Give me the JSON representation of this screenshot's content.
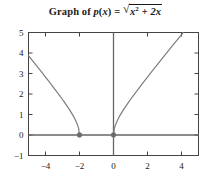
{
  "chart_data": {
    "type": "line",
    "title_parts": {
      "prefix": "Graph of ",
      "function_name": "p",
      "arg_open": "(",
      "arg_var": "x",
      "arg_close": ")",
      "equals": " = ",
      "radical_sign": "√",
      "radicand_term1_base": "x",
      "radicand_term1_exp": "2",
      "radicand_plus": " + ",
      "radicand_term2": "2x"
    },
    "xlabel": "",
    "ylabel": "",
    "xlim": [
      -5,
      5
    ],
    "ylim": [
      -1,
      5
    ],
    "xticks": [
      -4,
      -2,
      0,
      2,
      4
    ],
    "xtick_labels": [
      "−4",
      "−2",
      "0",
      "2",
      "4"
    ],
    "yticks": [
      -1,
      0,
      1,
      2,
      3,
      4,
      5
    ],
    "ytick_labels": [
      "−1",
      "0",
      "1",
      "2",
      "3",
      "4",
      "5"
    ],
    "grid": false,
    "legend": null,
    "axis_lines": {
      "x_axis_at_y": 0,
      "y_axis_at_x": 0,
      "color": "#666666"
    },
    "frame": {
      "visible": true,
      "color": "#444444"
    },
    "curve_color": "#7d7d7d",
    "marker_color": "#6b6b6b",
    "endpoint_markers": [
      {
        "x": -2,
        "y": 0,
        "style": "filled-circle"
      },
      {
        "x": 0,
        "y": 0,
        "style": "filled-circle"
      }
    ],
    "series": [
      {
        "name": "left-branch",
        "note": "x ≤ −2",
        "points": [
          {
            "x": -5.0,
            "y": 3.873
          },
          {
            "x": -4.8,
            "y": 3.666
          },
          {
            "x": -4.6,
            "y": 3.458
          },
          {
            "x": -4.4,
            "y": 3.25
          },
          {
            "x": -4.2,
            "y": 3.041
          },
          {
            "x": -4.0,
            "y": 2.828
          },
          {
            "x": -3.8,
            "y": 2.615
          },
          {
            "x": -3.6,
            "y": 2.4
          },
          {
            "x": -3.4,
            "y": 2.182
          },
          {
            "x": -3.2,
            "y": 1.96
          },
          {
            "x": -3.0,
            "y": 1.732
          },
          {
            "x": -2.9,
            "y": 1.616
          },
          {
            "x": -2.8,
            "y": 1.497
          },
          {
            "x": -2.7,
            "y": 1.375
          },
          {
            "x": -2.6,
            "y": 1.249
          },
          {
            "x": -2.5,
            "y": 1.118
          },
          {
            "x": -2.4,
            "y": 0.98
          },
          {
            "x": -2.3,
            "y": 0.831
          },
          {
            "x": -2.2,
            "y": 0.663
          },
          {
            "x": -2.1,
            "y": 0.458
          },
          {
            "x": -2.05,
            "y": 0.32
          },
          {
            "x": -2.0,
            "y": 0.0
          }
        ]
      },
      {
        "name": "right-branch",
        "note": "x ≥ 0",
        "points": [
          {
            "x": 0.0,
            "y": 0.0
          },
          {
            "x": 0.05,
            "y": 0.32
          },
          {
            "x": 0.1,
            "y": 0.458
          },
          {
            "x": 0.2,
            "y": 0.663
          },
          {
            "x": 0.3,
            "y": 0.831
          },
          {
            "x": 0.4,
            "y": 0.98
          },
          {
            "x": 0.5,
            "y": 1.118
          },
          {
            "x": 0.6,
            "y": 1.249
          },
          {
            "x": 0.7,
            "y": 1.375
          },
          {
            "x": 0.8,
            "y": 1.497
          },
          {
            "x": 0.9,
            "y": 1.616
          },
          {
            "x": 1.0,
            "y": 1.732
          },
          {
            "x": 1.2,
            "y": 1.96
          },
          {
            "x": 1.4,
            "y": 2.182
          },
          {
            "x": 1.6,
            "y": 2.4
          },
          {
            "x": 1.8,
            "y": 2.615
          },
          {
            "x": 2.0,
            "y": 2.828
          },
          {
            "x": 2.2,
            "y": 3.041
          },
          {
            "x": 2.4,
            "y": 3.25
          },
          {
            "x": 2.6,
            "y": 3.458
          },
          {
            "x": 2.8,
            "y": 3.666
          },
          {
            "x": 3.0,
            "y": 3.873
          },
          {
            "x": 3.2,
            "y": 4.079
          },
          {
            "x": 3.4,
            "y": 4.284
          },
          {
            "x": 3.6,
            "y": 4.49
          },
          {
            "x": 3.8,
            "y": 4.694
          },
          {
            "x": 4.0,
            "y": 4.899
          },
          {
            "x": 4.1,
            "y": 5.0
          }
        ]
      }
    ]
  }
}
